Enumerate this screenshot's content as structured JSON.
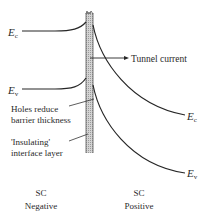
{
  "diagram": {
    "type": "semiconductor-band-diagram",
    "left_side": {
      "conduction_band_label": {
        "main": "E",
        "sub": "c"
      },
      "valence_band_label": {
        "main": "E",
        "sub": "v"
      },
      "title_line1": "SC",
      "title_line2": "Negative"
    },
    "right_side": {
      "conduction_band_label": {
        "main": "E",
        "sub": "c"
      },
      "valence_band_label": {
        "main": "E",
        "sub": "v"
      },
      "title_line1": "SC",
      "title_line2": "Positive"
    },
    "annotations": {
      "tunnel_current": "Tunnel current",
      "holes_line1": "Holes reduce",
      "holes_line2": "barrier thickness",
      "insulating_line1": "'Insulating'",
      "insulating_line2": "interface layer"
    },
    "colors": {
      "line": "#262626",
      "barrier_fill": "#c8c8c8",
      "background": "#ffffff"
    }
  }
}
